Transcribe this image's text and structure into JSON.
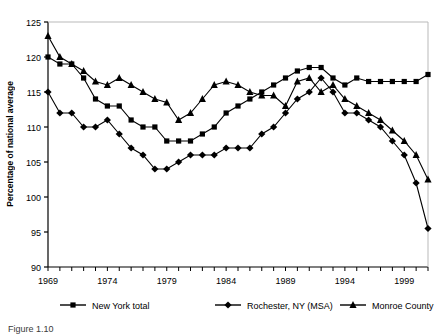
{
  "chart_data": {
    "type": "line",
    "title": "",
    "xlabel": "",
    "ylabel": "Percentage of national average",
    "xlim": [
      1969,
      2001
    ],
    "ylim": [
      90,
      125
    ],
    "ytick_labels": [
      "90",
      "95",
      "100",
      "105",
      "110",
      "115",
      "120",
      "125"
    ],
    "yticks": [
      90,
      95,
      100,
      105,
      110,
      115,
      120,
      125
    ],
    "xtick_labels": [
      "1969",
      "1974",
      "1979",
      "1984",
      "1989",
      "1994",
      "1999"
    ],
    "xticks": [
      1969,
      1974,
      1979,
      1984,
      1989,
      1994,
      1999
    ],
    "x": [
      1969,
      1970,
      1971,
      1972,
      1973,
      1974,
      1975,
      1976,
      1977,
      1978,
      1979,
      1980,
      1981,
      1982,
      1983,
      1984,
      1985,
      1986,
      1987,
      1988,
      1989,
      1990,
      1991,
      1992,
      1993,
      1994,
      1995,
      1996,
      1997,
      1998,
      1999,
      2000,
      2001
    ],
    "grid": false,
    "legend_position": "bottom",
    "series": [
      {
        "name": "New York total",
        "marker": "square",
        "values": [
          120,
          119,
          119,
          117,
          114,
          113,
          113,
          111,
          110,
          110,
          108,
          108,
          108,
          109,
          110,
          112,
          113,
          114,
          115,
          116,
          117,
          118,
          118.5,
          118.5,
          117,
          116,
          117,
          116.5,
          116.5,
          116.5,
          116.5,
          116.5,
          117.5
        ]
      },
      {
        "name": "Rochester, NY (MSA)",
        "marker": "diamond",
        "values": [
          115,
          112,
          112,
          110,
          110,
          111,
          109,
          107,
          106,
          104,
          104,
          105,
          106,
          106,
          106,
          107,
          107,
          107,
          109,
          110,
          112,
          114,
          115,
          117,
          115,
          112,
          112,
          111,
          110,
          108,
          106,
          102,
          95.5
        ]
      },
      {
        "name": "Monroe County",
        "marker": "triangle",
        "values": [
          123,
          120,
          119,
          118,
          116.5,
          116,
          117,
          116,
          115,
          114,
          113.5,
          111,
          112,
          114,
          116,
          116.5,
          116,
          115,
          114.5,
          114.5,
          113,
          116.5,
          117,
          115,
          116,
          114,
          113,
          112,
          111,
          109.5,
          108,
          106,
          102.5
        ]
      }
    ]
  },
  "legend": {
    "items": [
      {
        "label": "New York total",
        "marker": "square"
      },
      {
        "label": "Rochester, NY (MSA)",
        "marker": "diamond"
      },
      {
        "label": "Monroe County",
        "marker": "triangle"
      }
    ]
  },
  "caption": "Figure 1.10"
}
